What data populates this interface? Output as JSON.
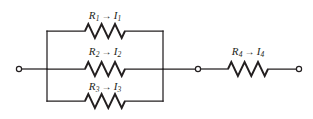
{
  "figure": {
    "kind": "electrical-circuit-diagram",
    "width": 313,
    "height": 119,
    "background_color": "#ffffff",
    "line_color": "#231f20"
  },
  "labels": {
    "branch1": {
      "resistor": "R",
      "resistor_sub": "1",
      "arrow": "→",
      "current": "I",
      "current_sub": "1",
      "text": "R₁ → I₁"
    },
    "branch2": {
      "resistor": "R",
      "resistor_sub": "2",
      "arrow": "→",
      "current": "I",
      "current_sub": "2",
      "text": "R₂ → I₂"
    },
    "branch3": {
      "resistor": "R",
      "resistor_sub": "3",
      "arrow": "→",
      "current": "I",
      "current_sub": "3",
      "text": "R₃ → I₃"
    },
    "branch4": {
      "resistor": "R",
      "resistor_sub": "4",
      "arrow": "→",
      "current": "I",
      "current_sub": "4",
      "text": "R₄ → I₄"
    }
  },
  "terminals": [
    {
      "name": "left-terminal",
      "cx": 19,
      "cy": 69,
      "r": 2.6
    },
    {
      "name": "middle-terminal",
      "cx": 198,
      "cy": 69,
      "r": 2.6
    },
    {
      "name": "right-terminal",
      "cx": 299,
      "cy": 69,
      "r": 2.6
    }
  ],
  "geometry": {
    "left_bus_x": 47,
    "right_bus_x": 163,
    "top_branch_y": 31,
    "middle_branch_y": 69,
    "bottom_branch_y": 101,
    "resistor_parallel_x1": 85,
    "resistor_parallel_x2": 125,
    "resistor_series_x1": 228,
    "resistor_series_x2": 268
  }
}
